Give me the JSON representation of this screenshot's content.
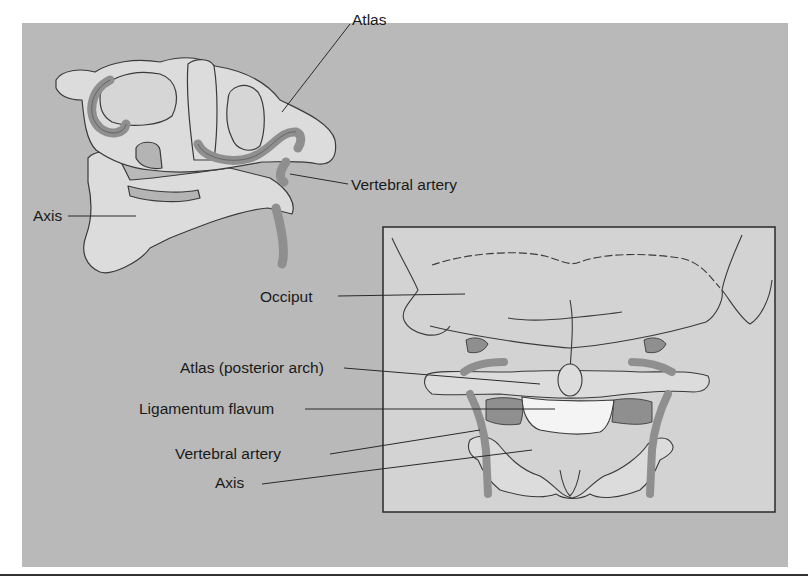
{
  "figure": {
    "colors": {
      "background": "#b9b9b9",
      "bone": "#dcdcdc",
      "inset_background": "#d3d3d3",
      "artery": "#8f8f8f",
      "ligament": "#f4f4f4",
      "outline": "#3a3a3a"
    },
    "top_view": {
      "labels": {
        "atlas": "Atlas",
        "vertebral_artery": "Vertebral artery",
        "axis": "Axis"
      }
    },
    "inset_view": {
      "labels": {
        "occiput": "Occiput",
        "atlas_posterior_arch": "Atlas (posterior arch)",
        "ligamentum_flavum": "Ligamentum flavum",
        "vertebral_artery": "Vertebral artery",
        "axis": "Axis"
      }
    }
  }
}
